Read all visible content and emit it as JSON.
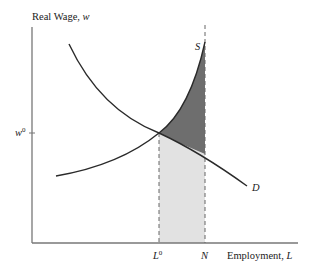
{
  "diagram": {
    "type": "labor-market supply-demand",
    "y_axis_label": "Real Wage, ",
    "y_axis_var": "w",
    "x_axis_label": "Employment, ",
    "x_axis_var": "L",
    "w0_label": "w",
    "w0_sup": "0",
    "L0_label": "L",
    "L0_sup": "0",
    "N_label": "N",
    "supply_label": "S",
    "demand_label": "D",
    "colors": {
      "curve": "#2a2a2a",
      "axis": "#777777",
      "dark_shade": "#6e6e6e",
      "light_shade": "#e2e2e2",
      "dashed": "#666666"
    }
  }
}
